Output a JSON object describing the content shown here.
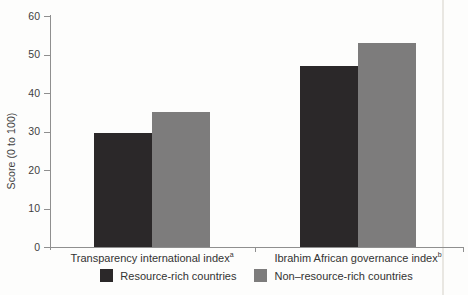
{
  "chart_data": {
    "type": "bar",
    "categories": [
      "Transparency international index",
      "Ibrahim African governance index"
    ],
    "category_superscripts": [
      "a",
      "b"
    ],
    "series": [
      {
        "name": "Resource-rich countries",
        "color": "#2b2829",
        "values": [
          29.5,
          47
        ]
      },
      {
        "name": "Non–resource-rich countries",
        "color": "#7d7c7c",
        "values": [
          35,
          53
        ]
      }
    ],
    "title": "",
    "xlabel": "",
    "ylabel": "Score (0 to 100)",
    "ylim": [
      0,
      60
    ],
    "yticks": [
      0,
      10,
      20,
      30,
      40,
      50,
      60
    ],
    "grid": false,
    "legend_position": "bottom"
  },
  "colors": {
    "axis": "#8f8f8f",
    "text": "#3b3b3b",
    "background": "#fdfdfc",
    "scan_artifact": "#dedbd4"
  }
}
